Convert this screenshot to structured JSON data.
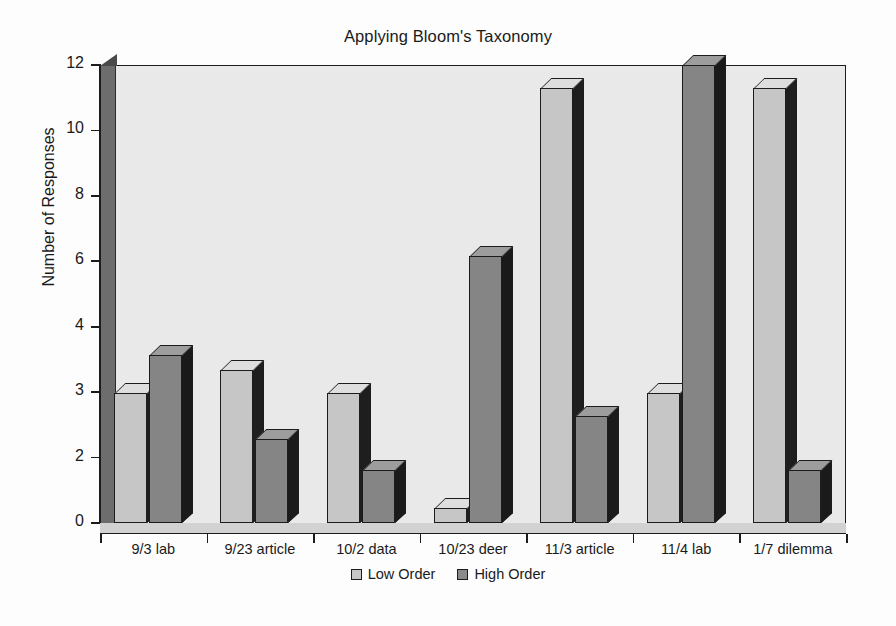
{
  "chart_data": {
    "type": "bar",
    "title": "Applying Bloom's Taxonomy",
    "xlabel": "",
    "ylabel": "Number of Responses",
    "grid": false,
    "legend_position": "bottom",
    "y_tick_labels": [
      "12",
      "10",
      "8",
      "6",
      "4",
      "3",
      "2",
      "0"
    ],
    "y_axis_note": "Eight evenly spaced tick positions labeled 12, 10, 8, 6, 4, 3, 2, 0 as printed on the chart",
    "ylim": [
      0,
      12
    ],
    "categories": [
      "9/3 lab",
      "9/23 article",
      "10/2 data",
      "10/23 deer",
      "11/3 article",
      "11/4 lab",
      "1/7 dilemma"
    ],
    "series": [
      {
        "name": "Low Order",
        "color": "#c6c6c6",
        "values": [
          3.4,
          4.0,
          3.4,
          0.4,
          11.4,
          3.4,
          11.4
        ]
      },
      {
        "name": "High Order",
        "color": "#858585",
        "values": [
          4.4,
          2.2,
          1.4,
          7.0,
          2.8,
          12.0,
          1.4
        ]
      }
    ]
  },
  "legend": {
    "items": [
      {
        "label": "Low Order",
        "swatch": "low"
      },
      {
        "label": "High Order",
        "swatch": "high"
      }
    ]
  },
  "colors": {
    "plot_background": "#e9e9e9",
    "axis": "#1c1c1c",
    "low_order": "#c6c6c6",
    "high_order": "#858585",
    "page_background": "#fdfdfd"
  }
}
